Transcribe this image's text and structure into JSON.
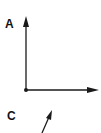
{
  "diagram": {
    "labels": {
      "a": "A",
      "c": "C"
    },
    "colors": {
      "stroke": "#1a1a1a",
      "background": "#ffffff"
    },
    "vectors": [
      {
        "name": "vertical-arrow",
        "from": [
          26,
          90
        ],
        "to": [
          26,
          17
        ]
      },
      {
        "name": "horizontal-arrow",
        "from": [
          26,
          90
        ],
        "to": [
          98,
          90
        ]
      },
      {
        "name": "diagonal-arrow",
        "from": [
          42,
          133
        ],
        "to": [
          52,
          111
        ]
      }
    ],
    "origin": [
      26,
      90
    ]
  }
}
